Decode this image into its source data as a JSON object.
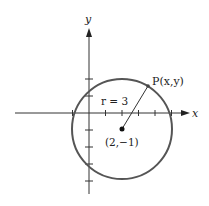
{
  "diagram": {
    "type": "circle-on-coordinate-plane",
    "axes": {
      "x_label": "x",
      "y_label": "y",
      "x_ticks": [
        -1,
        1,
        2,
        3,
        4,
        5
      ],
      "y_ticks": [
        2,
        1,
        -1,
        -2,
        -3,
        -4
      ]
    },
    "circle": {
      "center_label": "(2,−1)",
      "center": [
        2,
        -1
      ],
      "radius": 3,
      "radius_label": "r = 3"
    },
    "point": {
      "label": "P(x,y)"
    },
    "colors": {
      "circle": "#555555",
      "axes": "#333333",
      "text": "#222222"
    }
  }
}
